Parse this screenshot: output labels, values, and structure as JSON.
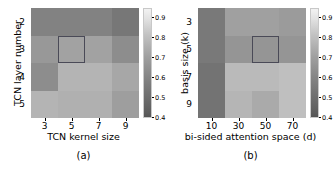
{
  "figure": {
    "type": "heatmap-pair",
    "background": "#ffffff",
    "colormap": "gray"
  },
  "panel_a": {
    "caption": "(a)",
    "xlabel": "TCN kernel size",
    "ylabel": "TCN layer number",
    "xticks": [
      "3",
      "5",
      "7",
      "9"
    ],
    "yticks": [
      "2",
      "3",
      "4",
      "5"
    ],
    "colorbar_ticks": [
      "0.9",
      "0.8",
      "0.7",
      "0.6",
      "0.5",
      "0.4"
    ],
    "highlight_cell": "row 3 (TCN layer number = 3), column 5 (TCN kernel size = 5)",
    "highlight_color": "#4a4a57"
  },
  "panel_b": {
    "caption": "(b)",
    "xlabel": "bi-sided attention space (d)",
    "ylabel": "basis size (k)",
    "xticks": [
      "10",
      "30",
      "50",
      "70"
    ],
    "yticks": [
      "3",
      "5",
      "7",
      "9"
    ],
    "colorbar_ticks": [
      "0.9",
      "0.8",
      "0.7",
      "0.6",
      "0.5",
      "0.4"
    ],
    "highlight_cell": "row 5 (basis size = 5), column 50 (bi-sided attention space = 50)",
    "highlight_color": "#4a4a57"
  },
  "chart_data": [
    {
      "type": "heatmap",
      "panel": "(a)",
      "title": "",
      "xlabel": "TCN kernel size",
      "ylabel": "TCN layer number",
      "x": [
        3,
        5,
        7,
        9
      ],
      "y": [
        2,
        3,
        4,
        5
      ],
      "colormap": "gray",
      "clim": [
        0.4,
        0.95
      ],
      "colorbar_ticks": [
        0.9,
        0.8,
        0.7,
        0.6,
        0.5,
        0.4
      ],
      "grid": false,
      "legend_position": "right-colorbar",
      "rows_top_to_bottom": [
        2,
        3,
        4,
        5
      ],
      "values": [
        [
          0.66,
          0.66,
          0.66,
          0.6
        ],
        [
          0.76,
          0.8,
          0.8,
          0.7
        ],
        [
          0.7,
          0.86,
          0.86,
          0.78
        ],
        [
          0.86,
          0.84,
          0.84,
          0.76
        ]
      ],
      "annotations": [
        {
          "type": "highlight-rectangle",
          "x": 5,
          "y": 3,
          "edgecolor": "#4a4a57",
          "linewidth": 1.4,
          "fill": false
        }
      ]
    },
    {
      "type": "heatmap",
      "panel": "(b)",
      "title": "",
      "xlabel": "bi-sided attention space (d)",
      "ylabel": "basis size (k)",
      "x": [
        10,
        30,
        50,
        70
      ],
      "y": [
        3,
        5,
        7,
        9
      ],
      "colormap": "gray",
      "clim": [
        0.4,
        0.95
      ],
      "colorbar_ticks": [
        0.9,
        0.8,
        0.7,
        0.6,
        0.5,
        0.4
      ],
      "grid": false,
      "legend_position": "right-colorbar",
      "rows_top_to_bottom": [
        3,
        5,
        7,
        9
      ],
      "values": [
        [
          0.61,
          0.79,
          0.79,
          0.76
        ],
        [
          0.61,
          0.74,
          0.74,
          0.74
        ],
        [
          0.58,
          0.88,
          0.88,
          0.9
        ],
        [
          0.58,
          0.86,
          0.82,
          0.9
        ]
      ],
      "annotations": [
        {
          "type": "highlight-rectangle",
          "x": 50,
          "y": 5,
          "edgecolor": "#4a4a57",
          "linewidth": 1.4,
          "fill": false
        }
      ]
    }
  ],
  "cell_colors": {
    "panel_a": [
      [
        "#828282",
        "#828282",
        "#828282",
        "#777777"
      ],
      [
        "#989898",
        "#a2a2a2",
        "#a2a2a2",
        "#8d8d8d"
      ],
      [
        "#8d8d8d",
        "#b4b4b4",
        "#b4b4b4",
        "#a7a7a7"
      ],
      [
        "#b4b4b4",
        "#b0b0b0",
        "#b0b0b0",
        "#9e9e9e"
      ]
    ],
    "panel_b": [
      [
        "#797979",
        "#a0a0a0",
        "#a0a0a0",
        "#9b9b9b"
      ],
      [
        "#797979",
        "#959595",
        "#959595",
        "#959595"
      ],
      [
        "#737373",
        "#bababa",
        "#bababa",
        "#bfbfbf"
      ],
      [
        "#737373",
        "#b5b5b5",
        "#aaaaaa",
        "#bfbfbf"
      ]
    ]
  }
}
